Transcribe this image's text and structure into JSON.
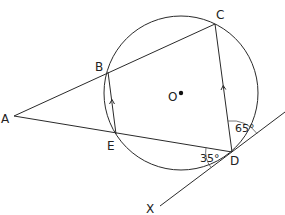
{
  "points": {
    "A": {
      "label": "A"
    },
    "B": {
      "label": "B"
    },
    "C": {
      "label": "C"
    },
    "D": {
      "label": "D"
    },
    "E": {
      "label": "E"
    },
    "O": {
      "label": "O"
    },
    "X": {
      "label": "X"
    }
  },
  "angles": {
    "angle_EDA": "35°",
    "angle_CD_tangent": "65°"
  },
  "colors": {
    "stroke": "#2a2a2a",
    "background": "#ffffff"
  }
}
